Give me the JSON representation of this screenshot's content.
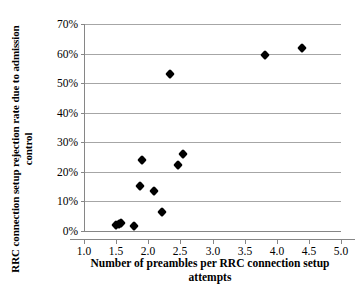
{
  "chart_data": {
    "type": "scatter",
    "title": "",
    "xlabel": "Number of preambles per RRC connection setup attempts",
    "ylabel": "RRC connection setup rejection rate due to admission control",
    "xlim": [
      1.0,
      5.0
    ],
    "ylim": [
      0,
      70
    ],
    "x_tick_labels": [
      "1.0",
      "1.5",
      "2.0",
      "2.5",
      "3.0",
      "3.5",
      "4.0",
      "4.5",
      "5.0"
    ],
    "x_tick_values": [
      1.0,
      1.5,
      2.0,
      2.5,
      3.0,
      3.5,
      4.0,
      4.5,
      5.0
    ],
    "y_tick_labels": [
      "0%",
      "10%",
      "20%",
      "30%",
      "40%",
      "50%",
      "60%",
      "70%"
    ],
    "y_tick_values": [
      0,
      10,
      20,
      30,
      40,
      50,
      60,
      70
    ],
    "y_unit": "%",
    "grid": "horizontal",
    "legend": "none",
    "marker": "diamond",
    "marker_color": "#000000",
    "series": [
      {
        "name": "observations",
        "points": [
          {
            "x": 1.49,
            "y": 2.0
          },
          {
            "x": 1.53,
            "y": 2.5
          },
          {
            "x": 1.56,
            "y": 2.8
          },
          {
            "x": 1.77,
            "y": 1.8
          },
          {
            "x": 1.85,
            "y": 15.3
          },
          {
            "x": 1.88,
            "y": 24.0
          },
          {
            "x": 2.07,
            "y": 13.5
          },
          {
            "x": 2.2,
            "y": 6.5
          },
          {
            "x": 2.33,
            "y": 53.0
          },
          {
            "x": 2.44,
            "y": 22.4
          },
          {
            "x": 2.52,
            "y": 26.0
          },
          {
            "x": 3.8,
            "y": 59.5
          },
          {
            "x": 4.37,
            "y": 62.0
          }
        ]
      }
    ]
  }
}
